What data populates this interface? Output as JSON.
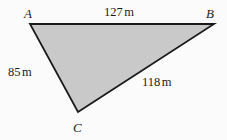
{
  "figure": {
    "type": "triangle-diagram",
    "background_color": "#fbfbfb",
    "fill_color": "#c9c9c9",
    "stroke_color": "#1a1a1a",
    "vertices": [
      {
        "name": "A",
        "label": "A",
        "x": 30,
        "y": 24
      },
      {
        "name": "B",
        "label": "B",
        "x": 214,
        "y": 24
      },
      {
        "name": "C",
        "label": "C",
        "x": 78,
        "y": 112
      }
    ],
    "sides": [
      {
        "name": "AB",
        "from": "A",
        "to": "B",
        "value": "127",
        "unit": "m",
        "label": "127 m"
      },
      {
        "name": "AC",
        "from": "A",
        "to": "C",
        "value": "85",
        "unit": "m",
        "label": "85 m"
      },
      {
        "name": "BC",
        "from": "B",
        "to": "C",
        "value": "118",
        "unit": "m",
        "label": "118 m"
      }
    ]
  },
  "chart_data": {
    "type": "diagram",
    "title": "",
    "shape": "triangle",
    "vertex_labels": [
      "A",
      "B",
      "C"
    ],
    "side_labels": [
      "127 m",
      "85 m",
      "118 m"
    ],
    "side_values": [
      127,
      85,
      118
    ],
    "side_unit": "m",
    "side_pairs": [
      [
        "A",
        "B"
      ],
      [
        "A",
        "C"
      ],
      [
        "B",
        "C"
      ]
    ],
    "vertex_coords": [
      [
        30,
        24
      ],
      [
        214,
        24
      ],
      [
        78,
        112
      ]
    ],
    "fill": "#c9c9c9",
    "stroke": "#1a1a1a",
    "grid": false,
    "legend": "none"
  }
}
